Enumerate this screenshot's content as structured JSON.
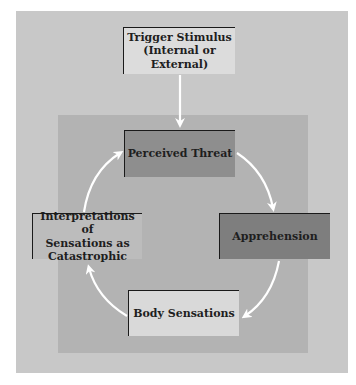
{
  "diagram": {
    "type": "cycle",
    "trigger": {
      "label": "Trigger Stimulus\n(Internal or External)",
      "line1": "Trigger Stimulus",
      "line2": "(Internal or External)"
    },
    "cycle_nodes": [
      {
        "id": "perceived-threat",
        "label": "Perceived Threat"
      },
      {
        "id": "apprehension",
        "label": "Apprehension"
      },
      {
        "id": "body-sensations",
        "label": "Body Sensations"
      },
      {
        "id": "interpretations",
        "label": "Interpretations of Sensations as Catastrophic",
        "line1": "Interpretations of",
        "line2": "Sensations as",
        "line3": "Catastrophic"
      }
    ],
    "edges": [
      {
        "from": "trigger",
        "to": "perceived-threat"
      },
      {
        "from": "perceived-threat",
        "to": "apprehension"
      },
      {
        "from": "apprehension",
        "to": "body-sensations"
      },
      {
        "from": "body-sensations",
        "to": "interpretations"
      },
      {
        "from": "interpretations",
        "to": "perceived-threat"
      }
    ],
    "colors": {
      "outer_panel": "#c8c8c8",
      "inner_panel": "#b3b3b3",
      "trigger_box": "#dcdcdc",
      "perceived_threat_box": "#8e8e8e",
      "apprehension_box": "#7e7e7e",
      "interpretations_box": "#bcbcbc",
      "body_sensations_box": "#d9d9d9",
      "arrow": "#ffffff"
    }
  }
}
